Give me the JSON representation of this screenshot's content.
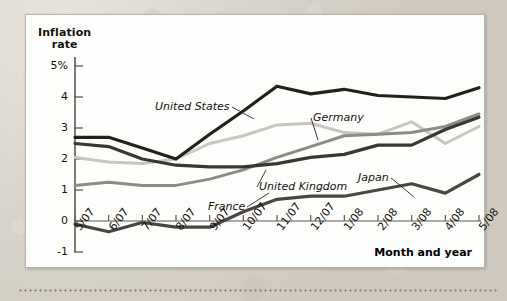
{
  "figure": {
    "y_axis_title_line1": "Inflation",
    "y_axis_title_line2": "rate",
    "x_axis_title": "Month and year"
  },
  "chart_data": {
    "type": "line",
    "title": "",
    "xlabel": "Month and year",
    "ylabel": "Inflation rate",
    "ylim": [
      -1,
      5
    ],
    "yticks": [
      "5%",
      "4",
      "3",
      "2",
      "1",
      "0",
      "-1"
    ],
    "ytick_values": [
      5,
      4,
      3,
      2,
      1,
      0,
      -1
    ],
    "grid": false,
    "legend": "inline-annotations",
    "categories": [
      "5/07",
      "6/07",
      "7/07",
      "8/07",
      "9/07",
      "10/07",
      "11/07",
      "12/07",
      "1/08",
      "2/08",
      "3/08",
      "4/08",
      "5/08"
    ],
    "series": [
      {
        "name": "United States",
        "color": "#231f1c",
        "values": [
          2.7,
          2.7,
          2.35,
          2.0,
          2.8,
          3.55,
          4.35,
          4.1,
          4.25,
          4.05,
          4.0,
          3.95,
          4.3
        ]
      },
      {
        "name": "Germany",
        "color": "#c9c6bf",
        "values": [
          2.05,
          1.9,
          1.85,
          2.0,
          2.5,
          2.75,
          3.1,
          3.15,
          2.85,
          2.8,
          3.2,
          2.5,
          3.05
        ]
      },
      {
        "name": "United Kingdom",
        "color": "#3a3632",
        "values": [
          2.5,
          2.4,
          2.0,
          1.8,
          1.75,
          1.75,
          1.85,
          2.05,
          2.15,
          2.45,
          2.45,
          2.95,
          3.35
        ]
      },
      {
        "name": "France",
        "color": "#8e8b85",
        "values": [
          1.15,
          1.25,
          1.15,
          1.15,
          1.35,
          1.65,
          2.05,
          2.4,
          2.75,
          2.8,
          2.85,
          3.05,
          3.45
        ]
      },
      {
        "name": "Japan",
        "color": "#4a4642",
        "values": [
          -0.1,
          -0.35,
          -0.05,
          -0.2,
          -0.2,
          0.3,
          0.7,
          0.8,
          0.8,
          1.0,
          1.2,
          0.9,
          1.5
        ]
      }
    ],
    "annotations": [
      {
        "text": "United States",
        "x": 154,
        "y": 92,
        "leader_to": [
          228,
          104
        ]
      },
      {
        "text": "Germany",
        "x": 312,
        "y": 103,
        "leader_to": [
          292,
          125
        ]
      },
      {
        "text": "United Kingdom",
        "x": 258,
        "y": 172,
        "leader_to": [
          240,
          155
        ]
      },
      {
        "text": "France",
        "x": 207,
        "y": 192,
        "leader_to": [
          243,
          178
        ]
      },
      {
        "text": "Japan",
        "x": 357,
        "y": 163,
        "leader_to": [
          388,
          182
        ]
      }
    ]
  }
}
